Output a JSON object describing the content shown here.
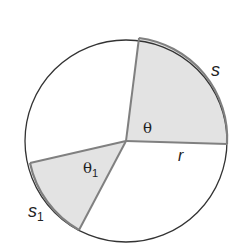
{
  "diagram": {
    "type": "circle-sectors",
    "colors": {
      "outline": "#333333",
      "radius_line": "#808080",
      "shaded_fill": "#e3e3e3",
      "background": "#ffffff"
    },
    "labels": {
      "theta": "θ",
      "theta1": "θ",
      "theta1_sub": "1",
      "r": "r",
      "s": "s",
      "s1": "s",
      "s1_sub": "1"
    }
  }
}
